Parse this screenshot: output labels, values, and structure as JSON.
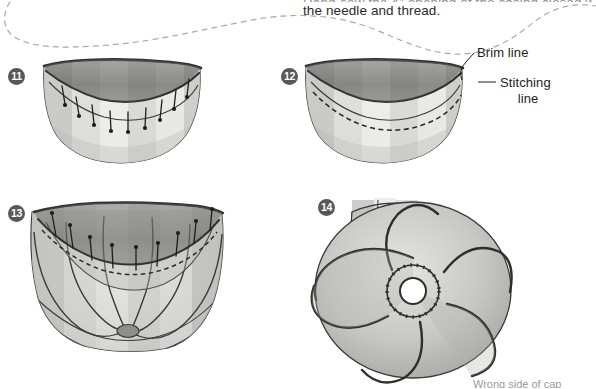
{
  "page": {
    "background_color": "#ffffff",
    "width": 596,
    "height": 389
  },
  "intro": {
    "line1_partial": "Hand-sew the 4\" opening of the casing closed with",
    "line2": "the needle and thread."
  },
  "divider": {
    "name": "dashed-wavy-divider",
    "color": "#a8a8a8",
    "style": "dashed"
  },
  "steps": [
    {
      "number": "11",
      "name": "step-11",
      "description": "Cap brim pinned along the stitching line with straight pins"
    },
    {
      "number": "12",
      "name": "step-12",
      "description": "Cap brim with dashed stitching line sewn, pins removed"
    },
    {
      "number": "13",
      "name": "step-13",
      "description": "Full cap with gathered panels pinned to brim"
    },
    {
      "number": "14",
      "name": "step-14",
      "description": "Top view of finished cap with six spiral panels and center opening"
    }
  ],
  "callouts": {
    "brim_line": "Brim line",
    "stitching_line_1": "Stitching",
    "stitching_line_2": "line"
  },
  "bottom_caption": {
    "partial_text": "Wrong side of cap"
  },
  "colors": {
    "step_badge_bg": "#58585a",
    "step_badge_text": "#ffffff",
    "ink": "#1d1d1d",
    "divider": "#a8a8a8",
    "fabric_light": "#e8e8e6",
    "fabric_mid": "#c9c9c6",
    "fabric_dark": "#a8a8a5",
    "brim_dark": "#4a4a4a"
  }
}
